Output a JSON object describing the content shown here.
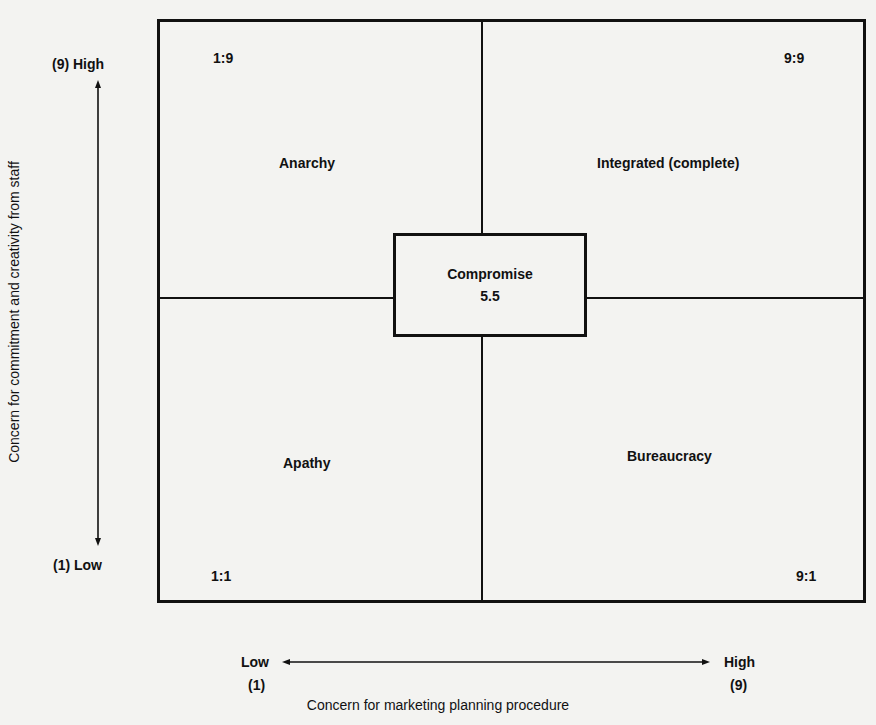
{
  "diagram": {
    "type": "2x2 matrix grid with central box",
    "y_axis": {
      "title": "Concern for commitment and creativity from staff",
      "high_label": "(9) High",
      "low_label": "(1) Low"
    },
    "x_axis": {
      "title": "Concern for marketing planning procedure",
      "low_label": "Low",
      "low_value": "(1)",
      "high_label": "High",
      "high_value": "(9)"
    },
    "quadrants": [
      {
        "position": "top-left",
        "coord": "1:9",
        "name": "Anarchy"
      },
      {
        "position": "top-right",
        "coord": "9:9",
        "name": "Integrated (complete)"
      },
      {
        "position": "bottom-left",
        "coord": "1:1",
        "name": "Apathy"
      },
      {
        "position": "bottom-right",
        "coord": "9:1",
        "name": "Bureaucracy"
      }
    ],
    "center": {
      "name": "Compromise",
      "coord": "5.5"
    }
  },
  "colors": {
    "ink": "#111111",
    "paper": "#f3f3f1"
  }
}
